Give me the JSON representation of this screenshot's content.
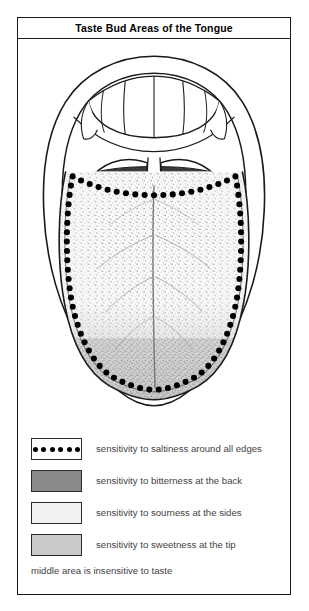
{
  "figure": {
    "title": "Taste Bud Areas of the Tongue",
    "footnote": "middle area is insensitive to taste"
  },
  "colors": {
    "outline": "#1a1a1a",
    "bitter_back": "#3a3a3a",
    "bitter_swatch": "#8a8a8a",
    "sour_sides": "#f2f2f2",
    "sweet_tip": "#c9c9c9",
    "papillae_dot": "#000000",
    "text": "#3f3f3f",
    "title_text": "#000000",
    "background": "#ffffff"
  },
  "diagram": {
    "name": "open-mouth-tongue-anatomy",
    "parts": [
      {
        "id": "lips-outer",
        "label": "lips outer contour"
      },
      {
        "id": "lips-inner",
        "label": "inner mouth opening"
      },
      {
        "id": "upper-teeth",
        "label": "upper teeth"
      },
      {
        "id": "soft-palate",
        "label": "soft palate"
      },
      {
        "id": "uvula",
        "label": "uvula"
      },
      {
        "id": "tonsil-left",
        "label": "left tonsil pillar"
      },
      {
        "id": "tonsil-right",
        "label": "right tonsil pillar"
      },
      {
        "id": "tongue-back",
        "label": "back of tongue (bitterness)"
      },
      {
        "id": "tongue-body",
        "label": "tongue body (sourness at sides)"
      },
      {
        "id": "tongue-tip",
        "label": "tip of tongue (sweetness)"
      },
      {
        "id": "median-sulcus",
        "label": "median sulcus groove"
      },
      {
        "id": "papillae-ring",
        "label": "taste bud dots around all edges (saltiness)"
      }
    ]
  },
  "legend": {
    "items": [
      {
        "id": "saltiness",
        "swatch": "dotted",
        "swatch_color": "#ffffff",
        "dot_count": 6,
        "label": "sensitivity to saltiness around all edges"
      },
      {
        "id": "bitterness",
        "swatch": "solid",
        "swatch_color": "#8a8a8a",
        "label": "sensitivity to bitterness at the back"
      },
      {
        "id": "sourness",
        "swatch": "solid",
        "swatch_color": "#f2f2f2",
        "label": "sensitivity to sourness at the sides"
      },
      {
        "id": "sweetness",
        "swatch": "solid",
        "swatch_color": "#c9c9c9",
        "label": "sensitivity to sweetness at the tip"
      }
    ]
  }
}
